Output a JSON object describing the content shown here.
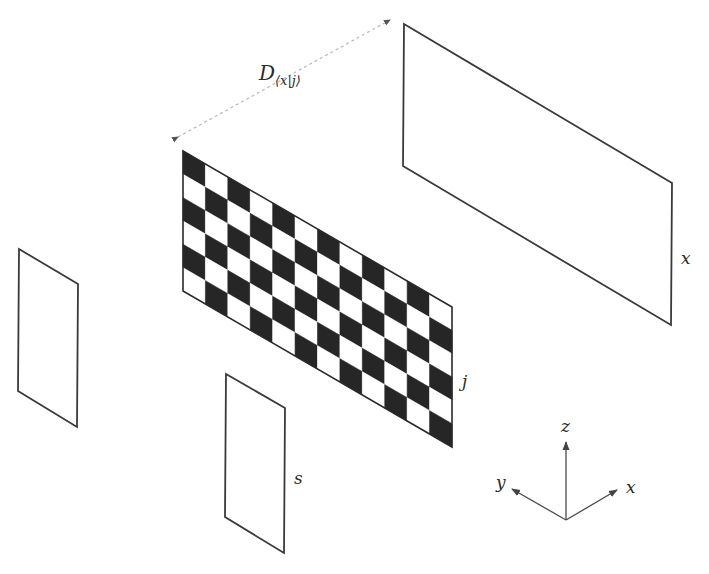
{
  "figure": {
    "colors": {
      "background": "#ffffff",
      "outline": "#3a3a3a",
      "checker_dark": "#262626",
      "checker_light": "#ffffff",
      "distance_arrow": "#b8b8b8"
    }
  },
  "distance_label": {
    "main": "D",
    "subscript": "⟨x|j⟩"
  },
  "planes": [
    {
      "id": "x",
      "label": "x",
      "kind": "outline"
    },
    {
      "id": "j",
      "label": "j",
      "kind": "checkerboard",
      "columns": 12,
      "rows": 6,
      "top_left_dark": true
    },
    {
      "id": "s",
      "label": "s",
      "kind": "outline"
    },
    {
      "id": "left",
      "label": "",
      "kind": "outline"
    }
  ],
  "axes": {
    "z": "z",
    "y": "y",
    "x": "x"
  }
}
